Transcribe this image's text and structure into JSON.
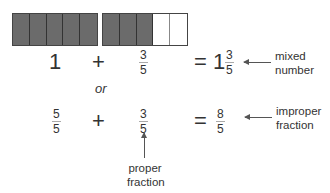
{
  "bars": {
    "whole": {
      "shaded": 5,
      "total": 5
    },
    "part": {
      "shaded": 3,
      "total": 5
    },
    "colors": {
      "shaded": "#6b6b6b",
      "empty": "#ffffff",
      "border": "#333333"
    }
  },
  "row1": {
    "whole": "1",
    "plus": "+",
    "frac_num": "3",
    "frac_den": "5",
    "equals": "=",
    "mixed_whole": "1",
    "mixed_num": "3",
    "mixed_den": "5",
    "label_line1": "mixed",
    "label_line2": "number"
  },
  "or_text": "or",
  "row2": {
    "frac1_num": "5",
    "frac1_den": "5",
    "plus": "+",
    "frac2_num": "3",
    "frac2_den": "5",
    "equals": "=",
    "result_num": "8",
    "result_den": "5",
    "label_line1": "improper",
    "label_line2": "fraction"
  },
  "bottom_label": {
    "line1": "proper",
    "line2": "fraction"
  }
}
